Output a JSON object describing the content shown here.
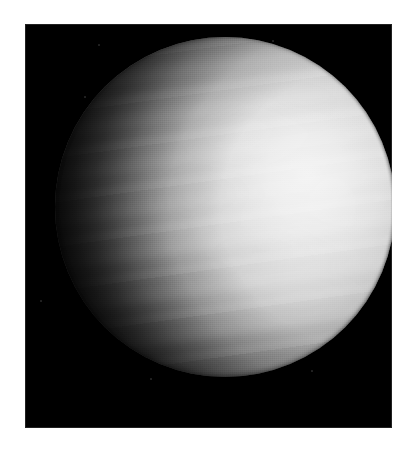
{
  "image": {
    "subject": "Venus",
    "phase": "gibbous",
    "caption": "",
    "kind": "astronomical-photograph",
    "medium": "monochrome print on white page"
  },
  "page": {
    "background_color": "#ffffff",
    "width": 408,
    "height": 451
  },
  "plate": {
    "background_color": "#000000",
    "left": 25,
    "top": 24,
    "width": 367,
    "height": 404,
    "border_color": "#969696"
  },
  "disk": {
    "center_x": 225,
    "center_y": 207,
    "radius": 170,
    "highlight_color": "#f2f2f2",
    "midtone_color": "#aaaaaa",
    "shadow_color": "#000000",
    "illumination": "lit from the right; terminator runs down the left side",
    "limb_right_x": 363,
    "limb_top_y": 57,
    "limb_bottom_y": 400,
    "terminator_x": 135
  },
  "specks": [
    {
      "x": 98,
      "y": 44,
      "size": 2
    },
    {
      "x": 84,
      "y": 96,
      "size": 2
    },
    {
      "x": 272,
      "y": 40,
      "size": 2
    },
    {
      "x": 40,
      "y": 300,
      "size": 2
    },
    {
      "x": 311,
      "y": 370,
      "size": 2
    },
    {
      "x": 150,
      "y": 378,
      "size": 2
    }
  ]
}
